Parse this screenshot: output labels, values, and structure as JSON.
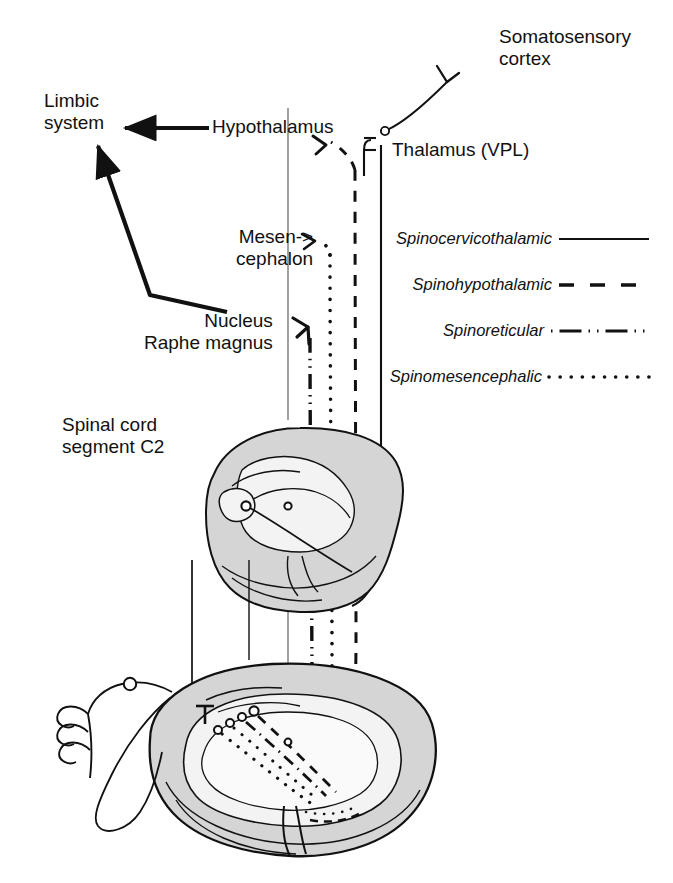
{
  "figure": {
    "background_color": "#ffffff",
    "ink_color": "#111111",
    "white_matter_fill": "#d5d5d5",
    "gray_matter_fill": "#f3f3f3"
  },
  "labels": {
    "somatosensory_cortex": "Somatosensory\ncortex",
    "thalamus": "Thalamus (VPL)",
    "hypothalamus": "Hypothalamus",
    "limbic_system": "Limbic\nsystem",
    "mesencephalon": "Mesen->\ncephalon",
    "nucleus_raphe_magnus": "Nucleus\nRaphe magnus",
    "spinal_cord_segment": "Spinal cord\nsegment C2"
  },
  "legend": {
    "position": "right-middle",
    "entries": [
      {
        "label": "Spinocervicothalamic",
        "style": "solid",
        "icon": "solid-line-icon"
      },
      {
        "label": "Spinohypothalamic",
        "style": "dashed",
        "icon": "dashed-line-icon"
      },
      {
        "label": "Spinoreticular",
        "style": "dash-dot-dot",
        "icon": "dash-dot-line-icon"
      },
      {
        "label": "Spinomesencephalic",
        "style": "dotted",
        "icon": "dotted-line-icon"
      }
    ]
  },
  "structures": [
    {
      "name": "spinal-cord-cross-section-c2",
      "kind": "cross-section",
      "position": "upper"
    },
    {
      "name": "spinal-cord-cross-section-lumbar",
      "kind": "cross-section",
      "position": "lower"
    },
    {
      "name": "peripheral-nerve-free-endings",
      "kind": "nerve",
      "position": "lower-left"
    },
    {
      "name": "dorsal-root-ganglion",
      "kind": "ganglion",
      "position": "lower-left"
    }
  ]
}
